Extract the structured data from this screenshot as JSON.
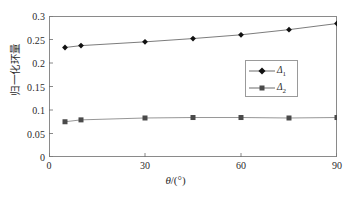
{
  "chart_data": {
    "type": "line",
    "title": "",
    "xlabel": "θ/(°)",
    "ylabel": "归一化环量",
    "xlim": [
      0,
      90
    ],
    "ylim": [
      0,
      0.3
    ],
    "grid": false,
    "legend_position": "center-right",
    "xticks": [
      0,
      30,
      60,
      90
    ],
    "xtick_labels": [
      "0",
      "30",
      "60",
      "90"
    ],
    "yticks": [
      0,
      0.05,
      0.1,
      0.15,
      0.2,
      0.25,
      0.3
    ],
    "ytick_labels": [
      "0",
      "0.05",
      "0.1",
      "0.15",
      "0.2",
      "0.25",
      "0.3"
    ],
    "x": [
      5,
      10,
      30,
      45,
      60,
      75,
      90
    ],
    "series": [
      {
        "name": "Δ1",
        "label_base": "Δ",
        "label_sub": "1",
        "marker": "diamond",
        "color": "#111111",
        "line_color": "#6d6d6d",
        "values": [
          0.233,
          0.237,
          0.245,
          0.252,
          0.26,
          0.271,
          0.284
        ]
      },
      {
        "name": "Δ2",
        "label_base": "Δ",
        "label_sub": "2",
        "marker": "square",
        "color": "#4a4a4a",
        "line_color": "#8a8a8a",
        "values": [
          0.075,
          0.079,
          0.083,
          0.084,
          0.084,
          0.083,
          0.084
        ]
      }
    ]
  },
  "axes": {
    "frame_color": "#8a8a8a",
    "tick_color": "#6b6b6b",
    "text_color": "#2b2b2b"
  },
  "legend": {
    "items": [
      {
        "base": "Δ",
        "sub": "1"
      },
      {
        "base": "Δ",
        "sub": "2"
      }
    ]
  },
  "xlabel_parts": {
    "theta": "θ",
    "slash_open": "/(",
    "degree": "°",
    "close": ")"
  }
}
